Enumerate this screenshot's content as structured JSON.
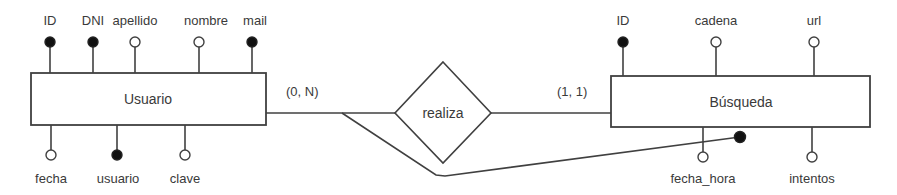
{
  "diagram": {
    "type": "entity-relationship",
    "colors": {
      "stroke": "#404040",
      "key_fill": "#111111",
      "attr_fill": "#ffffff",
      "text": "#3a3a3a"
    },
    "entities": [
      {
        "name": "Usuario",
        "box": {
          "x": 31,
          "y": 73,
          "w": 235,
          "h": 52
        },
        "attributes": [
          {
            "label": "ID",
            "key": true,
            "side": "top",
            "x": 50
          },
          {
            "label": "DNI",
            "key": true,
            "side": "top",
            "x": 93
          },
          {
            "label": "apellido",
            "key": false,
            "side": "top",
            "x": 135
          },
          {
            "label": "nombre",
            "key": false,
            "side": "top",
            "x": 199
          },
          {
            "label": "mail",
            "key": true,
            "side": "top",
            "x": 252
          },
          {
            "label": "fecha",
            "key": false,
            "side": "bottom",
            "x": 51
          },
          {
            "label": "usuario",
            "key": true,
            "side": "bottom",
            "x": 117
          },
          {
            "label": "clave",
            "key": false,
            "side": "bottom",
            "x": 185
          }
        ]
      },
      {
        "name": "Búsqueda",
        "box": {
          "x": 611,
          "y": 76,
          "w": 259,
          "h": 51
        },
        "attributes": [
          {
            "label": "ID",
            "key": true,
            "side": "top",
            "x": 623
          },
          {
            "label": "cadena",
            "key": false,
            "side": "top",
            "x": 716
          },
          {
            "label": "url",
            "key": false,
            "side": "top",
            "x": 814
          },
          {
            "label": "fecha_hora",
            "key": false,
            "side": "bottom",
            "x": 703
          },
          {
            "label": "intentos",
            "key": false,
            "side": "bottom",
            "x": 812
          }
        ]
      }
    ],
    "relationship": {
      "name": "realiza",
      "cardinality_left": "(0, N)",
      "cardinality_right": "(1, 1)"
    }
  }
}
